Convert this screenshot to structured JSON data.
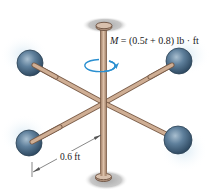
{
  "figure": {
    "moment_label": {
      "symbol": "M",
      "equals": " = (0.5",
      "var": "t",
      "rest": " + 0.8) lb · ft"
    },
    "dimension_label": "0.6 ft",
    "colors": {
      "rod": "#c7a489",
      "rod_edge": "#7a5c48",
      "ball": "#4f6f8c",
      "ball_highlight": "#9fb6c8",
      "glow": "#cfe3ef",
      "shadow": "#bdbdbd",
      "arrow": "#2a8fd0",
      "dim_line": "#555555"
    }
  }
}
